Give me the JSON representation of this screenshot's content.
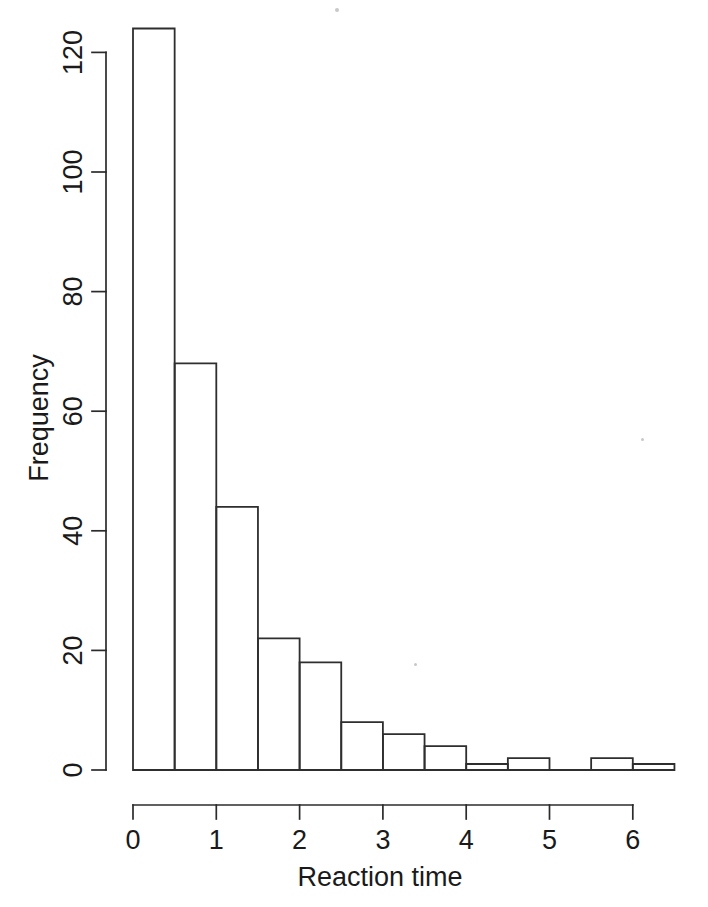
{
  "figure": {
    "background_color": "#ffffff",
    "ink_color": "#2b2b2b"
  },
  "chart_data": {
    "type": "bar",
    "subtype": "histogram",
    "title": "",
    "xlabel": "Reaction time",
    "ylabel": "Frequency",
    "xlim": [
      0,
      6.5
    ],
    "ylim": [
      0,
      124
    ],
    "bin_width": 0.5,
    "grid": false,
    "legend": null,
    "bin_edges": [
      0,
      0.5,
      1.0,
      1.5,
      2.0,
      2.5,
      3.0,
      3.5,
      4.0,
      4.5,
      5.0,
      5.5,
      6.0,
      6.5
    ],
    "categories": [
      "0-0.5",
      "0.5-1",
      "1-1.5",
      "1.5-2",
      "2-2.5",
      "2.5-3",
      "3-3.5",
      "3.5-4",
      "4-4.5",
      "4.5-5",
      "5-5.5",
      "5.5-6",
      "6-6.5"
    ],
    "values": [
      124,
      68,
      44,
      22,
      18,
      8,
      6,
      4,
      1,
      2,
      0,
      2,
      1
    ],
    "x_ticks": [
      0,
      1,
      2,
      3,
      4,
      5,
      6
    ],
    "x_tick_labels": [
      "0",
      "1",
      "2",
      "3",
      "4",
      "5",
      "6"
    ],
    "y_ticks": [
      0,
      20,
      40,
      60,
      80,
      100,
      120
    ],
    "y_tick_labels": [
      "0",
      "20",
      "40",
      "60",
      "80",
      "100",
      "120"
    ]
  }
}
